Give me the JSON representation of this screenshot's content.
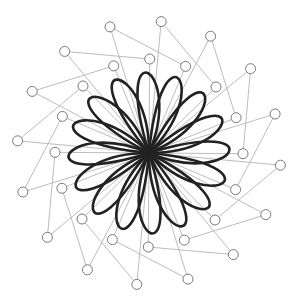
{
  "diagram": {
    "type": "bezier-rose",
    "center": [
      149,
      153
    ],
    "petal_count": 16,
    "inner_radius": 94,
    "outer_radius": 132,
    "control_point_radius": 5,
    "colors": {
      "background": "#ffffff",
      "petal_stroke": "#222222",
      "control_line": "#b4b4b4",
      "control_point_stroke": "#7a7a7a"
    }
  }
}
